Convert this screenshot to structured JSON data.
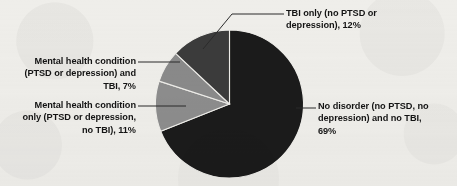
{
  "figure": {
    "background_color": "#efeeea",
    "text_color": "#141414"
  },
  "chart_data": {
    "type": "pie",
    "title": "",
    "subtitle": "",
    "xlabel": "",
    "ylabel": "",
    "legend_position": "callout-labels",
    "grid": false,
    "units": "percent",
    "start_angle_deg": 0,
    "direction": "clockwise",
    "categories": [
      "No disorder (no PTSD, no depression) and no TBI",
      "Mental health condition only (PTSD or depression, no TBI)",
      "Mental health condition (PTSD or depression) and TBI",
      "TBI only (no PTSD or depression)"
    ],
    "values": [
      69,
      11,
      7,
      12
    ],
    "colors": [
      "#1b1b1b",
      "#8d8d8d",
      "#8a8a8a",
      "#3b3b3b"
    ],
    "slices": [
      {
        "name": "no-disorder",
        "label": "No disorder (no PTSD, no\ndepression) and no TBI,\n69%",
        "value": 69,
        "value_text": "69%",
        "color": "#1b1b1b",
        "start_deg": 0,
        "end_deg": 248.4
      },
      {
        "name": "mental-health-only",
        "label": "Mental health  condition\nonly (PTSD or depression,\nno TBI), 11%",
        "value": 11,
        "value_text": "11%",
        "color": "#8d8d8d",
        "start_deg": 248.4,
        "end_deg": 288.0
      },
      {
        "name": "mental-health-and-tbi",
        "label": "Mental health  condition\n(PTSD or  depression) and\nTBI, 7%",
        "value": 7,
        "value_text": "7%",
        "color": "#8a8a8a",
        "start_deg": 288.0,
        "end_deg": 313.2
      },
      {
        "name": "tbi-only",
        "label": "TBI only (no PTSD  or\ndepression), 12%",
        "value": 12,
        "value_text": "12%",
        "color": "#3b3b3b",
        "start_deg": 313.2,
        "end_deg": 360.0
      }
    ]
  },
  "labels": {
    "tbi_only": "TBI only (no PTSD  or\ndepression), 12%",
    "no_disorder": "No disorder (no PTSD, no\ndepression) and no TBI,\n69%",
    "mh_and_tbi": "Mental health  condition\n(PTSD or  depression) and\nTBI, 7%",
    "mh_only": "Mental health  condition\nonly (PTSD or depression,\nno TBI), 11%"
  }
}
